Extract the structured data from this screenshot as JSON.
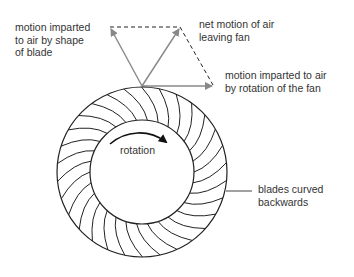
{
  "diagram": {
    "labels": {
      "shape_motion": [
        "motion imparted",
        "to air by shape",
        "of blade"
      ],
      "net_motion": [
        "net motion of air",
        "leaving fan"
      ],
      "rotation_motion": [
        "motion imparted to air",
        "by rotation of the fan"
      ],
      "rotation": "rotation",
      "blades": [
        "blades curved",
        "backwards"
      ]
    },
    "colors": {
      "arrow": "#888888",
      "line": "#222222",
      "text": "#333333"
    },
    "geometry": {
      "center": [
        142,
        172
      ],
      "outer_radius": 85,
      "inner_radius": 52,
      "blade_count": 30,
      "vector_origin": [
        142,
        86
      ],
      "shape_vector_tip": [
        110,
        27
      ],
      "net_vector_tip": [
        180,
        27
      ],
      "rotation_vector_tip": [
        213,
        85
      ]
    }
  }
}
